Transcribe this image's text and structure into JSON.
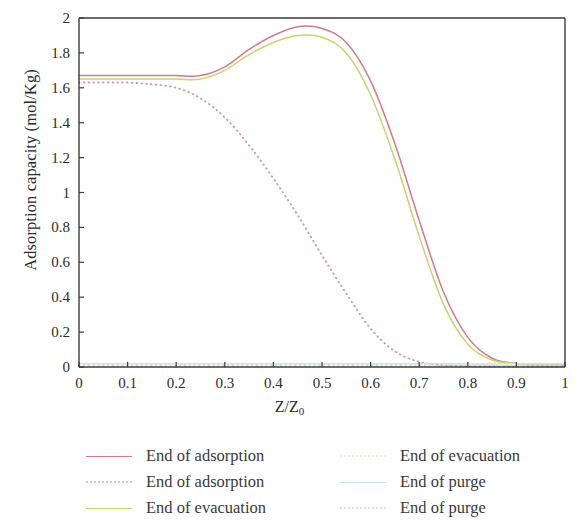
{
  "chart_data": {
    "type": "line",
    "title": "",
    "xlabel": "Z/Z",
    "xlabel_sub": "0",
    "ylabel": "Adsorption capacity (mol/Kg)",
    "xlim": [
      0,
      1
    ],
    "ylim": [
      0,
      2
    ],
    "xticks": [
      "0",
      "0.1",
      "0.2",
      "0.3",
      "0.4",
      "0.5",
      "0.6",
      "0.7",
      "0.8",
      "0.9",
      "1"
    ],
    "yticks": [
      "0",
      "0.2",
      "0.4",
      "0.6",
      "0.8",
      "1",
      "1.2",
      "1.4",
      "1.6",
      "1.8",
      "2"
    ],
    "grid": false,
    "legend_position": "below",
    "x": [
      0,
      0.05,
      0.1,
      0.15,
      0.2,
      0.25,
      0.3,
      0.35,
      0.4,
      0.45,
      0.5,
      0.55,
      0.6,
      0.65,
      0.7,
      0.75,
      0.8,
      0.85,
      0.9,
      0.95,
      1.0
    ],
    "series": [
      {
        "name": "End of adsorption",
        "style": "solid",
        "color": "#d4798d",
        "values": [
          1.67,
          1.67,
          1.67,
          1.67,
          1.67,
          1.67,
          1.72,
          1.82,
          1.9,
          1.95,
          1.94,
          1.86,
          1.64,
          1.28,
          0.84,
          0.43,
          0.17,
          0.05,
          0.02,
          0.01,
          0.01
        ]
      },
      {
        "name": "End of adsorption",
        "style": "dotted",
        "color": "#cf9aa6",
        "values": [
          1.63,
          1.63,
          1.63,
          1.62,
          1.6,
          1.54,
          1.43,
          1.27,
          1.08,
          0.87,
          0.64,
          0.42,
          0.22,
          0.09,
          0.03,
          0.01,
          0.005,
          0.004,
          0.003,
          0.003,
          0.003
        ]
      },
      {
        "name": "End of evacuation",
        "style": "solid",
        "color": "#c9d46a",
        "values": [
          1.65,
          1.65,
          1.65,
          1.65,
          1.65,
          1.65,
          1.7,
          1.79,
          1.86,
          1.9,
          1.89,
          1.8,
          1.56,
          1.19,
          0.75,
          0.36,
          0.13,
          0.04,
          0.02,
          0.01,
          0.01
        ]
      },
      {
        "name": "End of evacuation",
        "style": "dotted",
        "color": "#e8f0cc",
        "values": [
          0.012,
          0.012,
          0.012,
          0.012,
          0.012,
          0.012,
          0.012,
          0.012,
          0.012,
          0.012,
          0.013,
          0.013,
          0.014,
          0.014,
          0.015,
          0.016,
          0.017,
          0.018,
          0.019,
          0.02,
          0.021
        ]
      },
      {
        "name": "End of purge",
        "style": "solid",
        "color": "#c8e8e4",
        "values": [
          0.018,
          0.018,
          0.018,
          0.018,
          0.018,
          0.018,
          0.018,
          0.018,
          0.018,
          0.018,
          0.018,
          0.018,
          0.018,
          0.018,
          0.018,
          0.018,
          0.018,
          0.018,
          0.018,
          0.018,
          0.018
        ]
      },
      {
        "name": "End of purge",
        "style": "dotted",
        "color": "#d9d9d9",
        "values": [
          0.008,
          0.008,
          0.008,
          0.008,
          0.008,
          0.008,
          0.008,
          0.008,
          0.008,
          0.008,
          0.008,
          0.008,
          0.008,
          0.008,
          0.008,
          0.008,
          0.008,
          0.008,
          0.008,
          0.008,
          0.008
        ]
      }
    ]
  },
  "legend": {
    "items": [
      {
        "label": "End of adsorption",
        "color": "#d4798d",
        "style": "solid"
      },
      {
        "label": "End of evacuation",
        "color": "#eef3e0",
        "style": "dotted"
      },
      {
        "label": "End of adsorption",
        "color": "#dcc2c8",
        "style": "dotted"
      },
      {
        "label": "End of purge",
        "color": "#bfe4e0",
        "style": "solid"
      },
      {
        "label": "End of evacuation",
        "color": "#c9d46a",
        "style": "solid"
      },
      {
        "label": "End of purge",
        "color": "#e0e0e0",
        "style": "dotted"
      }
    ]
  },
  "axes": {
    "frame_color": "#3c3c3c"
  }
}
